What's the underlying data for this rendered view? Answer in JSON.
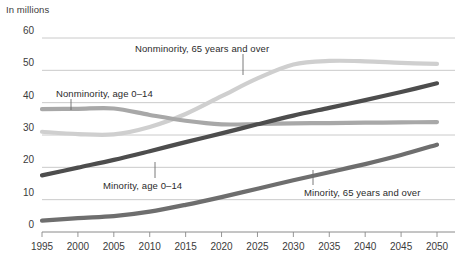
{
  "chart_data": {
    "type": "line",
    "title": "",
    "ylabel": "In millions",
    "xlabel": "",
    "ylim": [
      0,
      60
    ],
    "xlim": [
      1995,
      2050
    ],
    "grid": "horizontal",
    "legend_position": "inline-annotations",
    "ytick_labels": [
      "60",
      "50",
      "40",
      "30",
      "20",
      "10",
      "0"
    ],
    "ytick_values": [
      60,
      50,
      40,
      30,
      20,
      10,
      0
    ],
    "x": [
      1995,
      2000,
      2005,
      2010,
      2015,
      2020,
      2025,
      2030,
      2035,
      2040,
      2045,
      2050
    ],
    "xtick_labels": [
      "1995",
      "2000",
      "2005",
      "2010",
      "2015",
      "2020",
      "2025",
      "2030",
      "2035",
      "2040",
      "2045",
      "2050"
    ],
    "series": [
      {
        "name": "Nonminority, 65 years and over",
        "color": "#cfcfcf",
        "values": [
          31.0,
          30.3,
          30.2,
          32.5,
          36.5,
          42.0,
          47.5,
          51.8,
          52.9,
          52.8,
          52.3,
          52.0
        ]
      },
      {
        "name": "Nonminority, age 0–14",
        "color": "#a8a8a8",
        "values": [
          38.0,
          38.1,
          38.2,
          36.2,
          34.4,
          33.3,
          33.4,
          33.6,
          33.7,
          33.8,
          33.9,
          34.0
        ]
      },
      {
        "name": "Minority, age 0–14",
        "color": "#4d4d4d",
        "values": [
          17.5,
          19.9,
          22.3,
          25.0,
          27.8,
          30.5,
          33.3,
          36.0,
          38.4,
          40.8,
          43.3,
          46.0
        ]
      },
      {
        "name": "Minority, 65 years and over",
        "color": "#6e6e6e",
        "values": [
          3.5,
          4.3,
          4.9,
          6.3,
          8.4,
          10.8,
          13.4,
          16.0,
          18.5,
          21.0,
          23.8,
          27.0
        ]
      }
    ],
    "annotations": [
      {
        "id": "nonminority-65-over",
        "text": "Nonminority, 65 years and over",
        "label_x": 135,
        "label_y": 43,
        "leader_x": 243,
        "leader_y1": 54,
        "leader_y2": 75
      },
      {
        "id": "nonminority-0-14",
        "text": "Nonminority, age 0–14",
        "label_x": 56,
        "label_y": 88,
        "leader_x": 71,
        "leader_y1": 99,
        "leader_y2": 110
      },
      {
        "id": "minority-0-14",
        "text": "Minority, age 0–14",
        "label_x": 103,
        "label_y": 180,
        "leader_x": 155,
        "leader_y1": 162,
        "leader_y2": 178
      },
      {
        "id": "minority-65-over",
        "text": "Minority, 65 years and over",
        "label_x": 304,
        "label_y": 187,
        "leader_x": 313,
        "leader_y1": 170,
        "leader_y2": 185
      }
    ]
  }
}
